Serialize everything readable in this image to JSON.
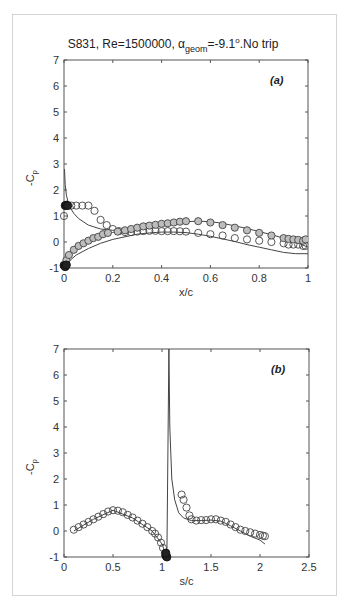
{
  "figure": {
    "title": "S831, Re=1500000, α",
    "title_sub": "geom",
    "title_rest": "=-9.1",
    "title_sup": "o",
    "title_end": ".No trip",
    "caption": ""
  },
  "chart_data": [
    {
      "panel": "(a)",
      "type": "scatter",
      "title": "S831, Re=1500000, α_geom=-9.1°.No trip",
      "xlabel": "x/c",
      "ylabel": "-C_p",
      "xlim": [
        0,
        1
      ],
      "ylim": [
        -1,
        7
      ],
      "xticks": [
        0,
        0.2,
        0.4,
        0.6,
        0.8,
        1
      ],
      "xtick_labels": [
        "0",
        "0.2",
        "0.4",
        "0.6",
        "0.8",
        "1"
      ],
      "yticks": [
        -1,
        0,
        1,
        2,
        3,
        4,
        5,
        6,
        7
      ],
      "ytick_labels": [
        "-1",
        "0",
        "1",
        "2",
        "3",
        "4",
        "5",
        "6",
        "7"
      ],
      "grid": false,
      "series": [
        {
          "name": "experiment open markers (upper row)",
          "style": "open-circle",
          "x": [
            0.0,
            0.01,
            0.03,
            0.05,
            0.075,
            0.1,
            0.125,
            0.15,
            0.175,
            0.2,
            0.225,
            0.25,
            0.275,
            0.3,
            0.325,
            0.35,
            0.375,
            0.4,
            0.425,
            0.45,
            0.475,
            0.5,
            0.55,
            0.6,
            0.65,
            0.7,
            0.75,
            0.8,
            0.85,
            0.9,
            0.92,
            0.94,
            0.96,
            0.98,
            0.99
          ],
          "y": [
            1.0,
            1.4,
            1.4,
            1.4,
            1.4,
            1.4,
            1.2,
            0.85,
            0.65,
            0.5,
            0.42,
            0.38,
            0.38,
            0.4,
            0.42,
            0.43,
            0.43,
            0.42,
            0.42,
            0.42,
            0.41,
            0.4,
            0.35,
            0.3,
            0.25,
            0.15,
            0.1,
            0.05,
            0.0,
            -0.05,
            -0.1,
            -0.1,
            -0.1,
            -0.15,
            -0.15
          ]
        },
        {
          "name": "experiment filled markers (lower row)",
          "style": "filled-circle",
          "x": [
            0.01,
            0.02,
            0.04,
            0.06,
            0.08,
            0.1,
            0.12,
            0.14,
            0.16,
            0.18,
            0.22,
            0.25,
            0.275,
            0.3,
            0.325,
            0.35,
            0.375,
            0.4,
            0.425,
            0.45,
            0.475,
            0.5,
            0.55,
            0.6,
            0.65,
            0.7,
            0.75,
            0.8,
            0.85,
            0.9,
            0.92,
            0.94,
            0.96,
            0.98,
            0.99
          ],
          "y": [
            -0.7,
            -0.5,
            -0.3,
            -0.15,
            -0.05,
            0.05,
            0.15,
            0.2,
            0.3,
            0.35,
            0.4,
            0.45,
            0.5,
            0.55,
            0.6,
            0.63,
            0.66,
            0.7,
            0.72,
            0.75,
            0.78,
            0.8,
            0.8,
            0.75,
            0.65,
            0.55,
            0.45,
            0.35,
            0.25,
            0.15,
            0.12,
            0.1,
            0.08,
            0.05,
            0.1
          ]
        },
        {
          "name": "leading edge dark markers",
          "style": "dark-circle",
          "x": [
            0.005,
            0.01,
            0.015,
            0.0,
            0.005,
            0.01
          ],
          "y": [
            1.4,
            1.42,
            1.4,
            -0.9,
            -0.95,
            -0.88
          ]
        },
        {
          "name": "simulation upper",
          "style": "line",
          "x": [
            0.002,
            0.005,
            0.01,
            0.02,
            0.04,
            0.06,
            0.1,
            0.15,
            0.2,
            0.25,
            0.3,
            0.35,
            0.4,
            0.45,
            0.5,
            0.55,
            0.6,
            0.65,
            0.7,
            0.75,
            0.8,
            0.85,
            0.9,
            0.95,
            1.0
          ],
          "y": [
            2.8,
            2.2,
            1.8,
            1.4,
            1.1,
            0.9,
            0.65,
            0.5,
            0.45,
            0.45,
            0.5,
            0.58,
            0.65,
            0.72,
            0.78,
            0.8,
            0.78,
            0.72,
            0.62,
            0.52,
            0.4,
            0.28,
            0.15,
            0.0,
            -0.2
          ]
        },
        {
          "name": "simulation lower",
          "style": "line",
          "x": [
            0.0,
            0.01,
            0.02,
            0.05,
            0.1,
            0.15,
            0.2,
            0.25,
            0.3,
            0.35,
            0.4,
            0.45,
            0.5,
            0.55,
            0.6,
            0.65,
            0.7,
            0.75,
            0.8,
            0.85,
            0.9,
            0.95,
            1.0
          ],
          "y": [
            -1.0,
            -0.9,
            -0.75,
            -0.5,
            -0.25,
            -0.05,
            0.1,
            0.2,
            0.3,
            0.35,
            0.38,
            0.38,
            0.36,
            0.3,
            0.22,
            0.12,
            0.02,
            -0.1,
            -0.2,
            -0.3,
            -0.4,
            -0.45,
            -0.45
          ]
        }
      ]
    },
    {
      "panel": "(b)",
      "type": "scatter",
      "xlabel": "s/c",
      "ylabel": "-C_p",
      "xlim": [
        0,
        2.5
      ],
      "ylim": [
        -1,
        7
      ],
      "xticks": [
        0,
        0.5,
        1,
        1.5,
        2,
        2.5
      ],
      "xtick_labels": [
        "0",
        "0.5",
        "1",
        "1.5",
        "2",
        "2.5"
      ],
      "yticks": [
        -1,
        0,
        1,
        2,
        3,
        4,
        5,
        6,
        7
      ],
      "ytick_labels": [
        "-1",
        "0",
        "1",
        "2",
        "3",
        "4",
        "5",
        "6",
        "7"
      ],
      "grid": false,
      "series": [
        {
          "name": "experiment (s/c)",
          "style": "open-circle",
          "x": [
            0.1,
            0.15,
            0.2,
            0.25,
            0.3,
            0.35,
            0.4,
            0.45,
            0.5,
            0.55,
            0.6,
            0.65,
            0.7,
            0.75,
            0.8,
            0.85,
            0.9,
            0.93,
            0.96,
            0.99,
            1.01,
            1.03,
            1.2,
            1.22,
            1.25,
            1.28,
            1.3,
            1.35,
            1.4,
            1.45,
            1.5,
            1.55,
            1.6,
            1.65,
            1.7,
            1.75,
            1.8,
            1.85,
            1.9,
            1.95,
            2.0,
            2.03,
            2.05
          ],
          "y": [
            0.05,
            0.15,
            0.25,
            0.35,
            0.45,
            0.55,
            0.65,
            0.75,
            0.8,
            0.78,
            0.72,
            0.62,
            0.52,
            0.4,
            0.28,
            0.15,
            0.0,
            -0.1,
            -0.25,
            -0.45,
            -0.65,
            -0.85,
            1.4,
            1.2,
            0.9,
            0.6,
            0.45,
            0.4,
            0.42,
            0.42,
            0.45,
            0.45,
            0.4,
            0.35,
            0.25,
            0.15,
            0.05,
            0.0,
            -0.05,
            -0.1,
            -0.15,
            -0.18,
            -0.2
          ]
        },
        {
          "name": "stagnation dark markers",
          "style": "dark-circle",
          "x": [
            1.04,
            1.05,
            1.04
          ],
          "y": [
            -0.95,
            -1.0,
            -0.85
          ]
        },
        {
          "name": "simulation",
          "style": "line",
          "x": [
            0.1,
            0.3,
            0.5,
            0.7,
            0.9,
            1.0,
            1.03,
            1.05,
            1.06,
            1.07,
            1.08,
            1.1,
            1.13,
            1.17,
            1.22,
            1.3,
            1.4,
            1.5,
            1.6,
            1.7,
            1.8,
            1.9,
            2.0,
            2.05
          ],
          "y": [
            0.0,
            0.45,
            0.8,
            0.5,
            0.0,
            -0.5,
            -0.8,
            -0.9,
            3.0,
            7.0,
            4.0,
            2.0,
            1.2,
            0.7,
            0.5,
            0.4,
            0.4,
            0.42,
            0.38,
            0.2,
            0.0,
            -0.2,
            -0.35,
            -0.5
          ]
        }
      ]
    }
  ]
}
